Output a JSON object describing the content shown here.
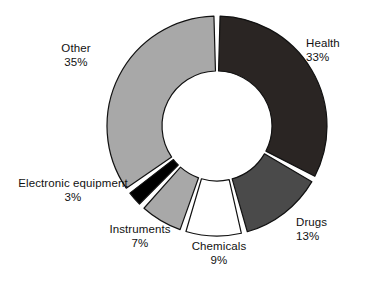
{
  "chart_data": {
    "type": "pie",
    "variant": "donut",
    "title": "",
    "subtitle": "",
    "xlabel": "",
    "ylabel": "",
    "grid": false,
    "legend": "none",
    "labels_position": "outside-radial",
    "units": "%",
    "total": 100,
    "start_angle_deg": 0,
    "direction": "clockwise",
    "categories": [
      "Health",
      "Drugs",
      "Chemicals",
      "Instruments",
      "Electronic equipment",
      "Other"
    ],
    "values": [
      33,
      13,
      9,
      7,
      3,
      35
    ],
    "colors": [
      "#2a2523",
      "#4a4a4a",
      "#ffffff",
      "#a8a8a8",
      "#000000",
      "#a8a8a8"
    ],
    "slices": [
      {
        "name": "Health",
        "value": 33,
        "value_text": "33%",
        "fill": "#2a2523",
        "stroke": "#111111"
      },
      {
        "name": "Drugs",
        "value": 13,
        "value_text": "13%",
        "fill": "#4a4a4a",
        "stroke": "#111111"
      },
      {
        "name": "Chemicals",
        "value": 9,
        "value_text": "9%",
        "fill": "#ffffff",
        "stroke": "#111111"
      },
      {
        "name": "Instruments",
        "value": 7,
        "value_text": "7%",
        "fill": "#a8a8a8",
        "stroke": "#111111"
      },
      {
        "name": "Electronic equipment",
        "value": 3,
        "value_text": "3%",
        "fill": "#000000",
        "stroke": "#111111"
      },
      {
        "name": "Other",
        "value": 35,
        "value_text": "35%",
        "fill": "#a8a8a8",
        "stroke": "#111111"
      }
    ],
    "geometry": {
      "cx": 217,
      "cy": 126,
      "outer_radius": 110,
      "inner_radius": 55,
      "gap_deg": 3.2
    },
    "background": "#ffffff"
  }
}
